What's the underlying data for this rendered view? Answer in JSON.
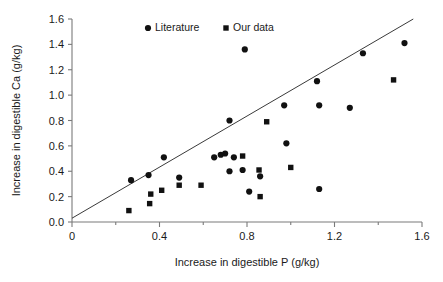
{
  "chart_data": {
    "type": "scatter",
    "title": "",
    "xlabel": "Increase in digestible P (g/kg)",
    "ylabel": "Increase in digestible  Ca (g/kg)",
    "xlim": [
      0,
      1.6
    ],
    "ylim": [
      0,
      1.6
    ],
    "xticks": [
      0,
      0.4,
      0.8,
      1.2,
      1.6
    ],
    "xtick_labels": [
      "0",
      "0.4",
      "0.8",
      "1.2",
      "1.6"
    ],
    "xminor_ticks": [
      0.2,
      0.6,
      1.0,
      1.4
    ],
    "yticks": [
      0.0,
      0.2,
      0.4,
      0.6,
      0.8,
      1.0,
      1.2,
      1.4,
      1.6
    ],
    "ytick_labels": [
      "0.0",
      "0.2",
      "0.4",
      "0.6",
      "0.8",
      "1.0",
      "1.2",
      "1.4",
      "1.6"
    ],
    "grid": false,
    "legend_position": "top-center",
    "marker_color": "#111111",
    "line_color": "#3a3a3a",
    "axis_color": "#7a7a7a",
    "reference_line": {
      "name": "1:1 reference line",
      "x": [
        0.0,
        1.56
      ],
      "y": [
        0.03,
        1.6
      ]
    },
    "series": [
      {
        "name": "Literature",
        "marker": "circle",
        "points": [
          [
            0.27,
            0.33
          ],
          [
            0.35,
            0.37
          ],
          [
            0.42,
            0.51
          ],
          [
            0.49,
            0.35
          ],
          [
            0.65,
            0.51
          ],
          [
            0.68,
            0.53
          ],
          [
            0.7,
            0.54
          ],
          [
            0.72,
            0.4
          ],
          [
            0.72,
            0.8
          ],
          [
            0.74,
            0.51
          ],
          [
            0.78,
            0.41
          ],
          [
            0.79,
            1.36
          ],
          [
            0.81,
            0.24
          ],
          [
            0.86,
            0.36
          ],
          [
            0.97,
            0.92
          ],
          [
            0.98,
            0.62
          ],
          [
            1.12,
            1.11
          ],
          [
            1.13,
            0.92
          ],
          [
            1.13,
            0.26
          ],
          [
            1.27,
            0.9
          ],
          [
            1.33,
            1.33
          ],
          [
            1.52,
            1.41
          ]
        ]
      },
      {
        "name": "Our data",
        "marker": "square",
        "points": [
          [
            0.26,
            0.09
          ],
          [
            0.355,
            0.145
          ],
          [
            0.36,
            0.22
          ],
          [
            0.41,
            0.25
          ],
          [
            0.49,
            0.29
          ],
          [
            0.59,
            0.29
          ],
          [
            0.78,
            0.52
          ],
          [
            0.855,
            0.41
          ],
          [
            0.86,
            0.2
          ],
          [
            0.89,
            0.79
          ],
          [
            1.0,
            0.43
          ],
          [
            1.47,
            1.12
          ]
        ]
      }
    ]
  },
  "legend": {
    "entries": [
      {
        "label": "Literature",
        "marker": "circle"
      },
      {
        "label": "Our data",
        "marker": "square"
      }
    ]
  }
}
